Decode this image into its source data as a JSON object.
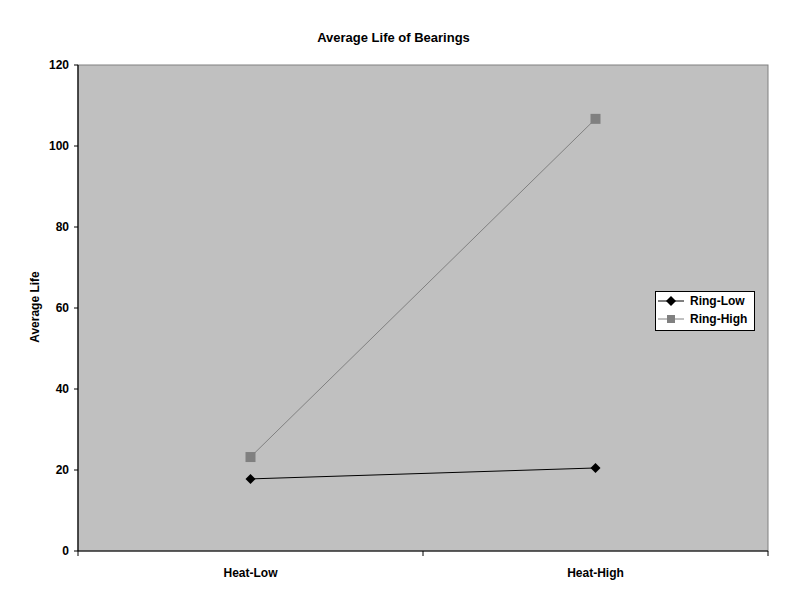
{
  "chart_data": {
    "type": "line",
    "title": "Average Life of Bearings",
    "xlabel": "",
    "ylabel": "Average Life",
    "categories": [
      "Heat-Low",
      "Heat-High"
    ],
    "series": [
      {
        "name": "Ring-Low",
        "values": [
          17.8,
          20.5
        ],
        "color": "#000000",
        "marker": "diamond"
      },
      {
        "name": "Ring-High",
        "values": [
          23.2,
          106.7
        ],
        "color": "#808080",
        "marker": "square"
      }
    ],
    "ylim": [
      0,
      120
    ],
    "yticks": [
      0,
      20,
      40,
      60,
      80,
      100,
      120
    ],
    "grid": false,
    "legend_position": "right",
    "plot_background": "#c0c0c0"
  }
}
